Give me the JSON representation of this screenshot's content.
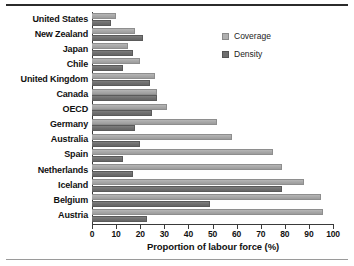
{
  "chart_data": {
    "type": "bar",
    "orientation": "horizontal",
    "title": "",
    "xlabel": "Proportion of labour force (%)",
    "ylabel": "",
    "xlim": [
      0,
      100
    ],
    "xticks": [
      0,
      10,
      20,
      30,
      40,
      50,
      60,
      70,
      80,
      90,
      100
    ],
    "grid": false,
    "legend_position": "upper right",
    "categories": [
      "United States",
      "New Zealand",
      "Japan",
      "Chile",
      "United Kingdom",
      "Canada",
      "OECD",
      "Germany",
      "Australia",
      "Spain",
      "Netherlands",
      "Iceland",
      "Belgium",
      "Austria"
    ],
    "series": [
      {
        "name": "Coverage",
        "color": "#ababab",
        "values": [
          10,
          18,
          15,
          20,
          26,
          27,
          31,
          52,
          58,
          75,
          79,
          88,
          95,
          96
        ]
      },
      {
        "name": "Density",
        "color": "#6f6f6f",
        "values": [
          8,
          21,
          17,
          13,
          24,
          27,
          25,
          18,
          20,
          13,
          17,
          79,
          49,
          23
        ]
      }
    ]
  },
  "legend": {
    "items": [
      {
        "label": "Coverage"
      },
      {
        "label": "Density"
      }
    ]
  },
  "axis": {
    "x_title": "Proportion of labour force (%)"
  }
}
